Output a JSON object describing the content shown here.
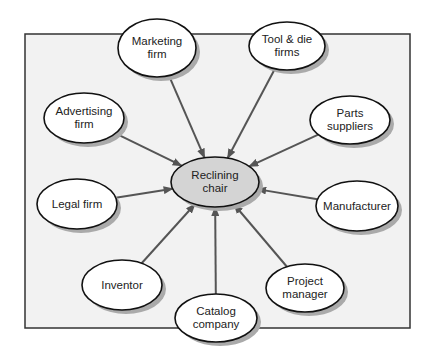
{
  "diagram": {
    "center": {
      "id": "center",
      "label_lines": [
        "Reclining",
        "chair"
      ],
      "cx": 215,
      "cy": 182,
      "rx": 44,
      "ry": 25,
      "fill": "#d4d4d4"
    },
    "nodes": [
      {
        "id": "marketing",
        "label_lines": [
          "Marketing",
          "firm"
        ],
        "cx": 157,
        "cy": 48,
        "rx": 39,
        "ry": 29
      },
      {
        "id": "tooldie",
        "label_lines": [
          "Tool & die",
          "firms"
        ],
        "cx": 287,
        "cy": 46,
        "rx": 38,
        "ry": 24
      },
      {
        "id": "advertising",
        "label_lines": [
          "Advertising",
          "firm"
        ],
        "cx": 84,
        "cy": 118,
        "rx": 40,
        "ry": 25
      },
      {
        "id": "parts",
        "label_lines": [
          "Parts",
          "suppliers"
        ],
        "cx": 350,
        "cy": 120,
        "rx": 40,
        "ry": 24
      },
      {
        "id": "legal",
        "label_lines": [
          "Legal firm"
        ],
        "cx": 77,
        "cy": 204,
        "rx": 40,
        "ry": 25
      },
      {
        "id": "manufacturer",
        "label_lines": [
          "Manufacturer"
        ],
        "cx": 357,
        "cy": 206,
        "rx": 41,
        "ry": 25
      },
      {
        "id": "inventor",
        "label_lines": [
          "Inventor"
        ],
        "cx": 122,
        "cy": 285,
        "rx": 40,
        "ry": 25
      },
      {
        "id": "project",
        "label_lines": [
          "Project",
          "manager"
        ],
        "cx": 305,
        "cy": 288,
        "rx": 39,
        "ry": 24
      },
      {
        "id": "catalog",
        "label_lines": [
          "Catalog",
          "company"
        ],
        "cx": 216,
        "cy": 318,
        "rx": 41,
        "ry": 24
      }
    ],
    "edges": [
      {
        "from": "marketing",
        "to": "center"
      },
      {
        "from": "tooldie",
        "to": "center"
      },
      {
        "from": "advertising",
        "to": "center"
      },
      {
        "from": "parts",
        "to": "center"
      },
      {
        "from": "legal",
        "to": "center"
      },
      {
        "from": "manufacturer",
        "to": "center"
      },
      {
        "from": "inventor",
        "to": "center"
      },
      {
        "from": "project",
        "to": "center"
      },
      {
        "from": "catalog",
        "to": "center"
      }
    ],
    "frame": {
      "x": 25,
      "y": 34,
      "w": 385,
      "h": 294,
      "fill": "#f2f2f2",
      "stroke": "#333333"
    },
    "colors": {
      "arrow": "#555555",
      "node_fill": "#ffffff",
      "node_stroke": "#111111",
      "shadow": "#aaaaaa"
    }
  }
}
